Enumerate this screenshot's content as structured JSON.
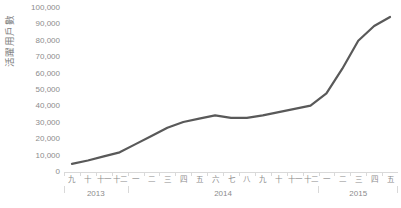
{
  "chart_data": {
    "type": "line",
    "title": "",
    "xlabel": "",
    "ylabel": "活躍用戶數",
    "ylim": [
      0,
      100000
    ],
    "ytick_labels": [
      "100,000",
      "90,000",
      "80,000",
      "70,000",
      "60,000",
      "50,000",
      "40,000",
      "30,000",
      "20,000",
      "10,000",
      "0"
    ],
    "ytick_values": [
      100000,
      90000,
      80000,
      70000,
      60000,
      50000,
      40000,
      30000,
      20000,
      10000,
      0
    ],
    "grid": false,
    "legend": false,
    "line_color": "#595959",
    "categories": [
      "九",
      "十",
      "十一",
      "十二",
      "一",
      "二",
      "三",
      "四",
      "五",
      "六",
      "七",
      "八",
      "九",
      "十",
      "十一",
      "十二",
      "一",
      "二",
      "三",
      "四",
      "五"
    ],
    "x_groups": [
      {
        "label": "2013",
        "count": 4
      },
      {
        "label": "2014",
        "count": 12
      },
      {
        "label": "2015",
        "count": 5
      }
    ],
    "series": [
      {
        "name": "活躍用戶數",
        "values": [
          5000,
          7000,
          9500,
          12000,
          17000,
          22000,
          27000,
          30500,
          32500,
          34500,
          33000,
          33000,
          34500,
          36500,
          38500,
          40500,
          48000,
          63000,
          80000,
          89000,
          94500
        ]
      }
    ]
  }
}
